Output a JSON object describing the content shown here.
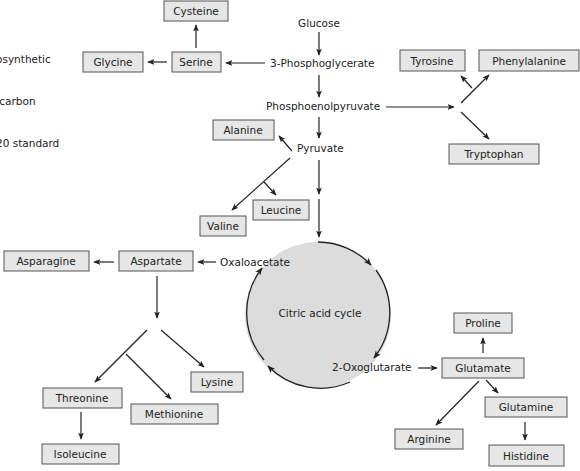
{
  "intro_text": [
    "osynthetic",
    " carbon",
    "20 standard"
  ],
  "colors": {
    "box_fill": "#e6e6e6",
    "box_border": "#555555",
    "cycle_fill": "#dcdcdc",
    "line": "#222222"
  },
  "metabolites": {
    "glucose": "Glucose",
    "phosphoglycerate": "3-Phosphoglycerate",
    "pep": "Phosphoenolpyruvate",
    "pyruvate": "Pyruvate",
    "oxaloacetate": "Oxaloacetate",
    "cycle": "Citric acid cycle",
    "oxoglutarate": "2-Oxoglutarate"
  },
  "amino_acids": {
    "cysteine": "Cysteine",
    "glycine": "Glycine",
    "serine": "Serine",
    "tyrosine": "Tyrosine",
    "phenylalanine": "Phenylalanine",
    "tryptophan": "Tryptophan",
    "alanine": "Alanine",
    "leucine": "Leucine",
    "valine": "Valine",
    "asparagine": "Asparagine",
    "aspartate": "Aspartate",
    "proline": "Proline",
    "glutamate": "Glutamate",
    "glutamine": "Glutamine",
    "arginine": "Arginine",
    "histidine": "Histidine",
    "threonine": "Threonine",
    "methionine": "Methionine",
    "lysine": "Lysine",
    "isoleucine": "Isoleucine"
  },
  "pathways": [
    {
      "from": "Glucose",
      "to": "3-Phosphoglycerate"
    },
    {
      "from": "3-Phosphoglycerate",
      "to": "Serine"
    },
    {
      "from": "Serine",
      "to": "Glycine"
    },
    {
      "from": "Serine",
      "to": "Cysteine"
    },
    {
      "from": "3-Phosphoglycerate",
      "to": "Phosphoenolpyruvate"
    },
    {
      "from": "Phosphoenolpyruvate",
      "to": "Tyrosine"
    },
    {
      "from": "Phosphoenolpyruvate",
      "to": "Phenylalanine"
    },
    {
      "from": "Phosphoenolpyruvate",
      "to": "Tryptophan"
    },
    {
      "from": "Phosphoenolpyruvate",
      "to": "Pyruvate"
    },
    {
      "from": "Pyruvate",
      "to": "Alanine"
    },
    {
      "from": "Pyruvate",
      "to": "Valine"
    },
    {
      "from": "Pyruvate",
      "to": "Leucine"
    },
    {
      "from": "Pyruvate",
      "to": "Citric acid cycle"
    },
    {
      "from": "Oxaloacetate",
      "to": "Aspartate"
    },
    {
      "from": "Aspartate",
      "to": "Asparagine"
    },
    {
      "from": "Aspartate",
      "to": "Threonine"
    },
    {
      "from": "Aspartate",
      "to": "Methionine"
    },
    {
      "from": "Aspartate",
      "to": "Lysine"
    },
    {
      "from": "Threonine",
      "to": "Isoleucine"
    },
    {
      "from": "2-Oxoglutarate",
      "to": "Glutamate"
    },
    {
      "from": "Glutamate",
      "to": "Proline"
    },
    {
      "from": "Glutamate",
      "to": "Glutamine"
    },
    {
      "from": "Glutamate",
      "to": "Arginine"
    },
    {
      "from": "Glutamine",
      "to": "Histidine"
    }
  ]
}
